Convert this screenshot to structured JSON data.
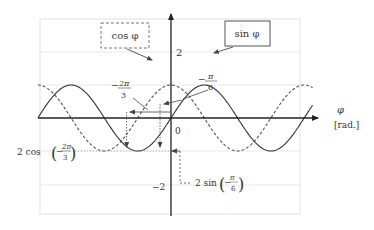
{
  "diagram": {
    "type": "trigonometric-plot",
    "colors": {
      "axis": "#222222",
      "curve": "#444444",
      "grid": "#e6e6e6",
      "frame": "#dddddd",
      "guide": "#555555"
    },
    "axes": {
      "x_label": "φ",
      "x_unit": "[rad.]",
      "y_max_label": "2",
      "y_min_label": "−2",
      "origin_label": "0"
    },
    "legend": {
      "cos_label": "cos φ",
      "cos_style": "dashed-box",
      "sin_label": "sin φ",
      "sin_style": "solid-box"
    },
    "annotations": {
      "neg_two_pi_over_three": {
        "sign": "−",
        "num": "2π",
        "den": "3"
      },
      "neg_pi_over_six": {
        "sign": "−",
        "num": "π",
        "den": "6"
      },
      "cos_value": {
        "prefix": "2 cos",
        "sign": "−",
        "num": "2π",
        "den": "3"
      },
      "sin_value": {
        "prefix": "2 sin",
        "sign": "−",
        "num": "π",
        "den": "6"
      }
    }
  },
  "chart_data": {
    "type": "line",
    "title": "",
    "xlabel": "φ [rad.]",
    "ylabel": "",
    "xlim": [
      -6.28,
      6.8
    ],
    "ylim": [
      -2,
      2
    ],
    "grid": true,
    "series": [
      {
        "name": "cos φ",
        "formula": "2*cos(x)",
        "style": "dashed",
        "amplitude": 2
      },
      {
        "name": "sin φ",
        "formula": "2*sin(x)",
        "style": "solid",
        "amplitude": 2
      }
    ],
    "marked_points": [
      {
        "x_label": "−2π/3",
        "x": -2.094,
        "series": "cos φ",
        "y": -1,
        "y_label": "2 cos(−2π/3)"
      },
      {
        "x_label": "−π/6",
        "x": -0.524,
        "series": "sin φ",
        "y": -1,
        "y_label": "2 sin(−π/6)"
      }
    ],
    "y_ticks": [
      -2,
      0,
      2
    ]
  }
}
